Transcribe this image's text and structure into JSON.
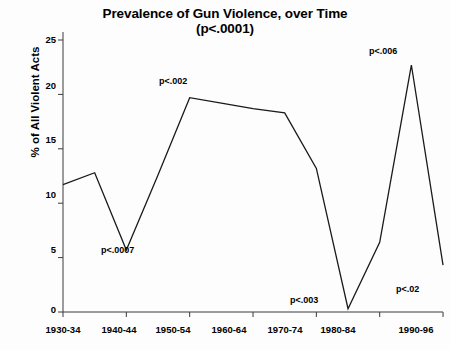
{
  "chart_data": {
    "type": "line",
    "title": "Prevalence of Gun Violence, over Time",
    "subtitle": "(p<.0001)",
    "xlabel": "",
    "ylabel": "% of All Violent Acts",
    "categories": [
      "1930-34",
      "1935-39",
      "1940-44",
      "1945-49",
      "1950-54",
      "1955-59",
      "1960-64",
      "1965-69",
      "1970-74",
      "1975-79",
      "1980-84",
      "1985-89",
      "1990-96"
    ],
    "x_tick_labels": [
      "1930-34",
      "1940-44",
      "1950-54",
      "1960-64",
      "1970-74",
      "1980-84",
      "1990-96"
    ],
    "y_tick_labels": [
      "0",
      "5",
      "10",
      "15",
      "20",
      "25"
    ],
    "y_tick_values": [
      0,
      5,
      10,
      15,
      20,
      25
    ],
    "ylim": [
      0,
      25
    ],
    "grid": false,
    "legend": "none",
    "series": [
      {
        "name": "% of All Violent Acts",
        "values": [
          11.7,
          12.8,
          5.7,
          12.6,
          19.7,
          19.2,
          18.7,
          18.3,
          13.2,
          0.3,
          6.4,
          22.7,
          4.3
        ]
      }
    ],
    "annotations": [
      {
        "text": "p<.0007",
        "category": "1940-44",
        "value": 5.7
      },
      {
        "text": "p<.002",
        "category": "1950-54",
        "value": 19.7
      },
      {
        "text": "p<.003",
        "category": "1975-79",
        "value": 0.3
      },
      {
        "text": "p<.006",
        "category": "1985-89",
        "value": 22.7
      },
      {
        "text": "p<.02",
        "category": "1990-96",
        "value": 4.3
      }
    ],
    "line_color": "#1a1a1a",
    "background_color": "#fdfdfd",
    "axis_color": "#3a3a3a"
  },
  "layout": {
    "plot_left": 63,
    "plot_right": 443,
    "plot_top": 40,
    "plot_bottom": 312,
    "x_step": 31.67,
    "y_scale_px_per_unit": 10.88
  },
  "ticks": {
    "y": [
      {
        "label": "25",
        "top": 35,
        "value": 25
      },
      {
        "label": "20",
        "top": 81,
        "value": 20
      },
      {
        "label": "15",
        "top": 135,
        "value": 15
      },
      {
        "label": "10",
        "top": 190,
        "value": 10
      },
      {
        "label": "5",
        "top": 245,
        "value": 5
      },
      {
        "label": "0",
        "top": 305,
        "value": 0
      }
    ],
    "x": [
      {
        "label": "1930-34",
        "left": 33
      },
      {
        "label": "1940-44",
        "left": 89
      },
      {
        "label": "1950-54",
        "left": 143
      },
      {
        "label": "1960-64",
        "left": 199
      },
      {
        "label": "1970-74",
        "left": 255
      },
      {
        "label": "1980-84",
        "left": 308
      },
      {
        "label": "1990-96",
        "left": 386
      }
    ]
  },
  "notes": [
    {
      "text": "p<.0007",
      "left": 101,
      "top": 245
    },
    {
      "text": "p<.002",
      "left": 159,
      "top": 76
    },
    {
      "text": "p<.003",
      "left": 290,
      "top": 295
    },
    {
      "text": "p<.006",
      "left": 369,
      "top": 46
    },
    {
      "text": "p<.02",
      "left": 396,
      "top": 284
    }
  ]
}
